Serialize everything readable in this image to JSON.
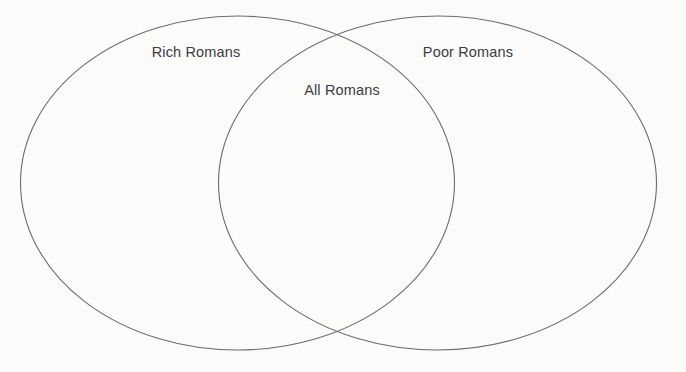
{
  "diagram": {
    "type": "venn",
    "title": "",
    "background_color": "#fbfbfa",
    "stroke_color": "#6b6b70",
    "label_color": "#3c3c42",
    "sets": [
      {
        "id": "left",
        "label": "Rich Romans",
        "label_x": 196,
        "label_y": 53,
        "cx": 237.5,
        "cy": 183,
        "rx": 217,
        "ry": 167
      },
      {
        "id": "right",
        "label": "Poor Romans",
        "label_x": 468,
        "label_y": 53,
        "cx": 437.5,
        "cy": 183,
        "rx": 219,
        "ry": 167
      }
    ],
    "intersection": {
      "id": "overlap",
      "label": "All Romans",
      "label_x": 342,
      "label_y": 91
    }
  }
}
